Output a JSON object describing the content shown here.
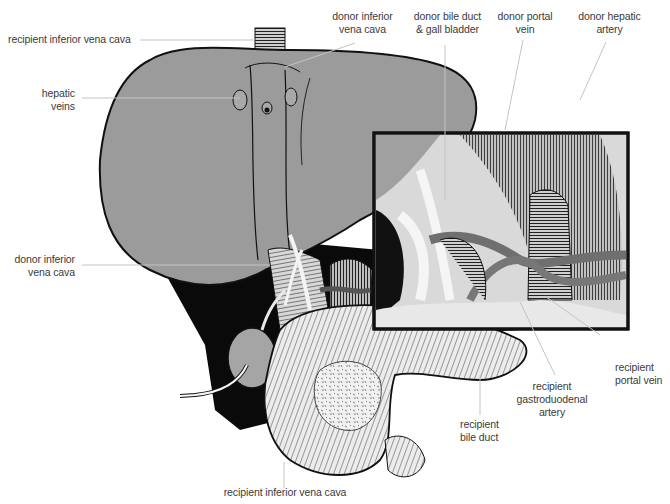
{
  "diagram": {
    "colors": {
      "liver_fill": "#9b9b9b",
      "outline": "#111111",
      "shadow": "#0a0a0a",
      "leader_line": "#c4c4c4",
      "label_text": "#3a3a3a",
      "pancreas_fill": "#e9e9e9",
      "inset_border": "#111111"
    },
    "labels": {
      "recipient_ivc_top": [
        "recipient inferior vena cava"
      ],
      "donor_ivc_top": [
        "donor inferior",
        "vena cava"
      ],
      "donor_bile_duct": [
        "donor bile duct",
        "& gall bladder"
      ],
      "donor_portal_vein": [
        "donor portal",
        "vein"
      ],
      "donor_hepatic_artery": [
        "donor hepatic",
        "artery"
      ],
      "hepatic_veins": [
        "hepatic",
        "veins"
      ],
      "donor_ivc_left": [
        "donor inferior",
        "vena cava"
      ],
      "recipient_portal_vein": [
        "recipient",
        "portal vein"
      ],
      "recipient_gda": [
        "recipient",
        "gastroduodenal",
        "artery"
      ],
      "recipient_bile_duct": [
        "recipient",
        "bile duct"
      ],
      "recipient_ivc_bottom": [
        "recipient inferior vena cava"
      ]
    },
    "structures": [
      "liver",
      "inset-magnified-view",
      "pancreas",
      "duodenum",
      "gall-bladder",
      "drain-tube",
      "inferior-vena-cava",
      "portal-vein",
      "hepatic-artery",
      "bile-duct"
    ]
  }
}
